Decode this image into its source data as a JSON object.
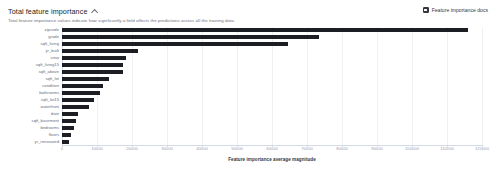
{
  "header": {
    "title": "Total feature importance",
    "collapse_icon": "chevron-up-icon",
    "docs_link": "Feature importance docs",
    "docs_icon": "documentation-icon",
    "subtitle": "Total feature importance values indicate how significantly a field affects the predictions across all the training data."
  },
  "chart_data": {
    "type": "bar",
    "orientation": "horizontal",
    "title": "Total feature importance",
    "xlabel": "Feature importance average magnitude",
    "ylabel": "",
    "xlim": [
      0,
      120000
    ],
    "grid": true,
    "legend": null,
    "bar_color": "#1c1e23",
    "xticks": [
      0,
      10000,
      20000,
      30000,
      40000,
      50000,
      60000,
      70000,
      80000,
      90000,
      100000,
      110000,
      120000
    ],
    "xticklabels": [
      "0",
      "10000",
      "20000",
      "30000",
      "40000",
      "50000",
      "60000",
      "70000",
      "80000",
      "90000",
      "100000",
      "110000",
      "120000"
    ],
    "categories": [
      "zipcode",
      "grade",
      "sqft_living",
      "yr_built",
      "view",
      "sqft_living15",
      "sqft_above",
      "sqft_lot",
      "condition",
      "bathrooms",
      "sqft_lot15",
      "waterfront",
      "date",
      "sqft_basement",
      "bedrooms",
      "floors",
      "yr_renovated"
    ],
    "values": [
      116000,
      73500,
      64500,
      21800,
      18200,
      17500,
      17300,
      13400,
      11700,
      10800,
      9200,
      7800,
      4700,
      4000,
      3500,
      2500,
      1900
    ]
  }
}
